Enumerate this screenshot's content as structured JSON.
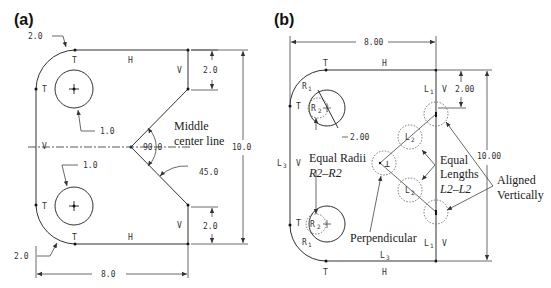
{
  "panels": [
    {
      "label": "(a)",
      "dimensions": {
        "top_fillet_radius": "2.0",
        "bottom_fillet_radius": "2.0",
        "top_hole_diameter": "1.0",
        "bottom_hole_diameter": "1.0",
        "top_right_offset": "2.0",
        "bottom_right_offset": "2.0",
        "height": "10.0",
        "width": "8.0",
        "v_angle": "90.0",
        "lower_angle": "45.0"
      },
      "constraints": {
        "tangent": "T",
        "horizontal": "H",
        "vertical": "V"
      },
      "annotation": [
        "Middle",
        "center line"
      ]
    },
    {
      "label": "(b)",
      "dimensions": {
        "width": "8.00",
        "height": "10.00",
        "top_offset": "2.00",
        "circle_diameter": "2.00"
      },
      "constraint_symbols": {
        "tangent": "T",
        "horizontal": "H",
        "vertical": "V",
        "radius1": "R",
        "radius1_sub": "1",
        "radius2": "R",
        "radius2_sub": "2",
        "length1": "L",
        "length1_sub": "1",
        "length2": "L",
        "length2_sub": "2",
        "length3": "L",
        "length3_sub": "3",
        "perpendicular": "⊥"
      },
      "annotations": {
        "equal_radii": [
          "Equal Radii",
          "R2–R2"
        ],
        "equal_lengths": [
          "Equal",
          "Lengths",
          "L2–L2"
        ],
        "perpendicular": "Perpendicular",
        "aligned": [
          "Aligned",
          "Vertically"
        ]
      }
    }
  ]
}
